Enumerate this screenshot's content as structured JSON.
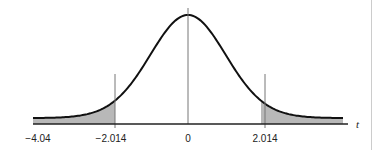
{
  "chart_data": {
    "type": "area",
    "title": "",
    "xlabel": "t",
    "ylabel": "",
    "tick_labels": [
      "−4.04",
      "−2.014",
      "0",
      "2.014"
    ],
    "tick_values": [
      -4.04,
      -2.014,
      0,
      2.014
    ],
    "shaded_regions": [
      {
        "from": -4.04,
        "to": -2.014,
        "tail": "left"
      },
      {
        "from": 2.014,
        "to": 4.04,
        "tail": "right"
      }
    ],
    "critical_values": [
      -2.014,
      2.014
    ],
    "center": 0,
    "grid": false,
    "legend": null,
    "colors": {
      "curve": "#111111",
      "shade": "#b8b8b8",
      "axis": "#222222",
      "guides": "#777777"
    }
  },
  "labels": {
    "axis_var": "t",
    "tick_m404": "−4.04",
    "tick_m2014": "−2.014",
    "tick_0": "0",
    "tick_2014": "2.014"
  }
}
